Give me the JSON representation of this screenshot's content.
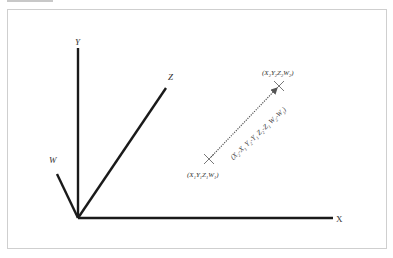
{
  "diagram": {
    "type": "4d-coordinate-vector-diagram",
    "axes": [
      {
        "name": "X",
        "label": "X"
      },
      {
        "name": "Y",
        "label": "Y"
      },
      {
        "name": "Z",
        "label": "Z"
      },
      {
        "name": "W",
        "label": "W"
      }
    ],
    "points": [
      {
        "id": "p1",
        "label": "(X1 Y1 Z1 W1)",
        "parts": [
          "X",
          "1",
          "Y",
          "1",
          "Z",
          "1",
          "W",
          "1"
        ]
      },
      {
        "id": "p2",
        "label": "(X2 Y2 Z2 W2)",
        "parts": [
          "X",
          "2",
          "Y",
          "2",
          "Z",
          "2",
          "W",
          "2"
        ]
      }
    ],
    "vector": {
      "label": "(X2-X1 Y2-Y1 Z2-Z1 W2-W1)",
      "style": "dotted-arrow",
      "from": "p1",
      "to": "p2"
    },
    "labels": {
      "x_axis": "X",
      "y_axis": "Y",
      "z_axis": "Z",
      "w_axis": "W",
      "p1_open": "(",
      "p1_x": "X",
      "p1_x_sub": "1",
      "p1_y": "Y",
      "p1_y_sub": "1",
      "p1_z": "Z",
      "p1_z_sub": "1",
      "p1_w": "W",
      "p1_w_sub": "1",
      "p1_close": ")",
      "p2_open": "(",
      "p2_x": "X",
      "p2_x_sub": "2",
      "p2_y": "Y",
      "p2_y_sub": "2",
      "p2_z": "Z",
      "p2_z_sub": "2",
      "p2_w": "W",
      "p2_w_sub": "2",
      "p2_close": ")",
      "v_1": "(X",
      "v_1s": "2",
      "v_2": "-X",
      "v_2s": "1",
      "v_3": " Y",
      "v_3s": "2",
      "v_4": "-Y",
      "v_4s": "1",
      "v_5": " Z",
      "v_5s": "2",
      "v_6": "-Z",
      "v_6s": "1",
      "v_7": " W",
      "v_7s": "2",
      "v_8": "-W",
      "v_8s": "1",
      "v_9": ")"
    },
    "colors": {
      "axis": "#1a1a1a",
      "frame": "#cfcfcf",
      "text": "#333333",
      "vector": "#555555"
    }
  }
}
